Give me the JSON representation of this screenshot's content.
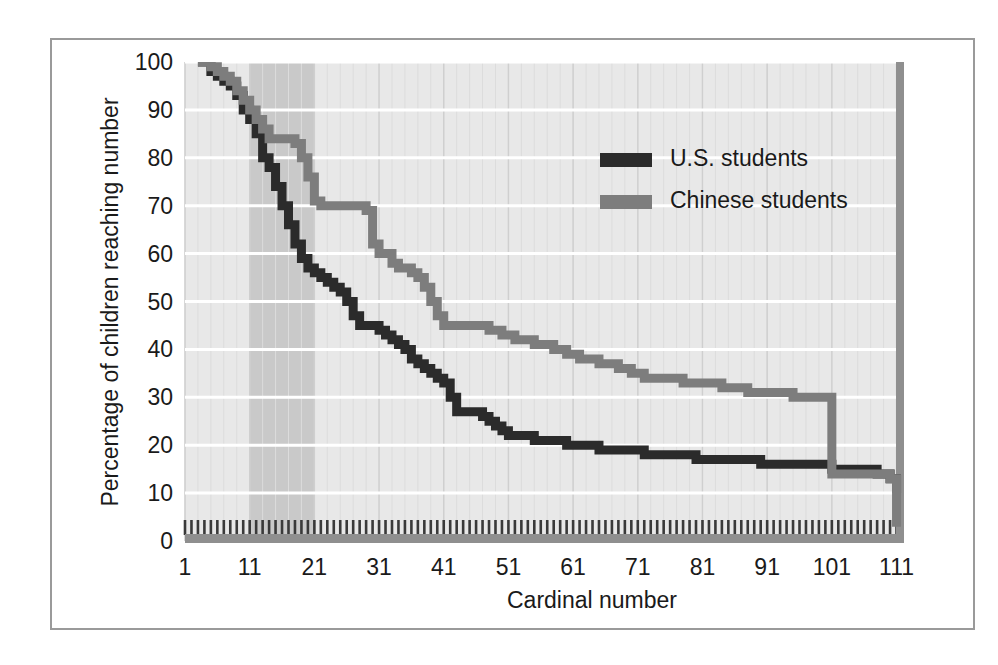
{
  "chart_data": {
    "type": "line",
    "title": "",
    "xlabel": "Cardinal number",
    "ylabel": "Percentage of children reaching number",
    "xlim": [
      1,
      112
    ],
    "ylim": [
      0,
      100
    ],
    "xticks": [
      1,
      11,
      21,
      31,
      41,
      51,
      61,
      71,
      81,
      91,
      101,
      111
    ],
    "xticklabels": [
      "1",
      "11",
      "21",
      "31",
      "41",
      "51",
      "61",
      "71",
      "81",
      "91",
      "101",
      "111"
    ],
    "yticks": [
      0,
      10,
      20,
      30,
      40,
      50,
      60,
      70,
      80,
      90,
      100
    ],
    "yticklabels": [
      "0",
      "10",
      "20",
      "30",
      "40",
      "50",
      "60",
      "70",
      "80",
      "90",
      "100"
    ],
    "grid": "horizontal-major-and-vertical-minor",
    "legend_position": "upper-right-inside",
    "highlight_band": {
      "x_start": 11,
      "x_end": 21,
      "color": "#c9c9c9"
    },
    "plot_background": "#e8e8e8",
    "series": [
      {
        "name": "U.S. students",
        "color": "#2b2b2b",
        "x": [
          3,
          4,
          5,
          6,
          7,
          8,
          9,
          10,
          11,
          12,
          13,
          14,
          15,
          16,
          17,
          18,
          19,
          20,
          21,
          22,
          23,
          24,
          25,
          26,
          27,
          28,
          29,
          30,
          31,
          32,
          33,
          34,
          35,
          36,
          37,
          38,
          39,
          40,
          41,
          42,
          43,
          44,
          45,
          46,
          47,
          48,
          49,
          50,
          51,
          52,
          55,
          58,
          60,
          62,
          65,
          68,
          70,
          72,
          75,
          78,
          80,
          84,
          88,
          90,
          95,
          100,
          101,
          105,
          108,
          110,
          111
        ],
        "y": [
          100,
          100,
          98,
          97,
          96,
          95,
          93,
          90,
          88,
          85,
          80,
          78,
          74,
          70,
          66,
          62,
          59,
          57,
          56,
          55,
          54,
          53,
          52,
          50,
          47,
          45,
          45,
          45,
          44,
          43,
          42,
          41,
          40,
          38,
          37,
          36,
          35,
          34,
          33,
          30,
          27,
          27,
          27,
          27,
          26,
          25,
          24,
          23,
          22,
          22,
          21,
          21,
          20,
          20,
          19,
          19,
          19,
          18,
          18,
          18,
          17,
          17,
          17,
          16,
          16,
          16,
          15,
          15,
          14,
          13,
          10
        ]
      },
      {
        "name": "Chinese students",
        "color": "#7d7d7d",
        "x": [
          3,
          4,
          5,
          6,
          7,
          8,
          9,
          10,
          11,
          12,
          13,
          14,
          15,
          16,
          17,
          18,
          19,
          20,
          21,
          22,
          23,
          24,
          25,
          26,
          27,
          28,
          29,
          30,
          31,
          32,
          33,
          34,
          35,
          36,
          37,
          38,
          39,
          40,
          41,
          42,
          43,
          45,
          48,
          50,
          52,
          55,
          58,
          60,
          62,
          65,
          68,
          70,
          72,
          75,
          78,
          80,
          84,
          88,
          90,
          95,
          99,
          100,
          101,
          104,
          108,
          110,
          111
        ],
        "y": [
          100,
          100,
          99,
          98,
          97,
          96,
          94,
          92,
          90,
          88,
          86,
          84,
          84,
          84,
          84,
          83,
          80,
          76,
          71,
          70,
          70,
          70,
          70,
          70,
          70,
          70,
          69,
          62,
          60,
          60,
          58,
          57,
          57,
          56,
          55,
          53,
          50,
          47,
          45,
          45,
          45,
          45,
          44,
          43,
          42,
          41,
          40,
          39,
          38,
          37,
          36,
          35,
          34,
          34,
          33,
          33,
          32,
          31,
          31,
          30,
          30,
          30,
          14,
          14,
          14,
          13,
          3
        ]
      }
    ]
  },
  "legend": {
    "items": [
      {
        "label": "U.S. students",
        "color": "#2b2b2b"
      },
      {
        "label": "Chinese students",
        "color": "#7d7d7d"
      }
    ]
  },
  "axes": {
    "x_title": "Cardinal number",
    "y_title": "Percentage of children reaching number"
  }
}
